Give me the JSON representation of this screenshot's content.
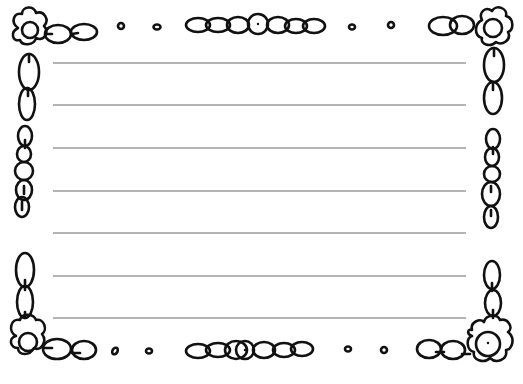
{
  "page": {
    "type": "lined writing paper with doodle flower border",
    "background": "#ffffff",
    "ink_color": "#111111",
    "rule_color": "#6a6a6a"
  },
  "ruled_lines": {
    "count": 7,
    "x_start": 53,
    "x_end": 466,
    "y_positions": [
      63,
      105,
      148,
      191,
      233,
      276,
      318
    ]
  },
  "border": {
    "corners": [
      "flower-top-left",
      "flower-top-right",
      "flower-bottom-left",
      "flower-bottom-right"
    ],
    "top_center": "bead-garland",
    "bottom_center": "bead-garland",
    "left_middle": "bead-chain",
    "right_middle": "bead-chain",
    "small_dots_top": 4,
    "small_dots_bottom": 4
  }
}
